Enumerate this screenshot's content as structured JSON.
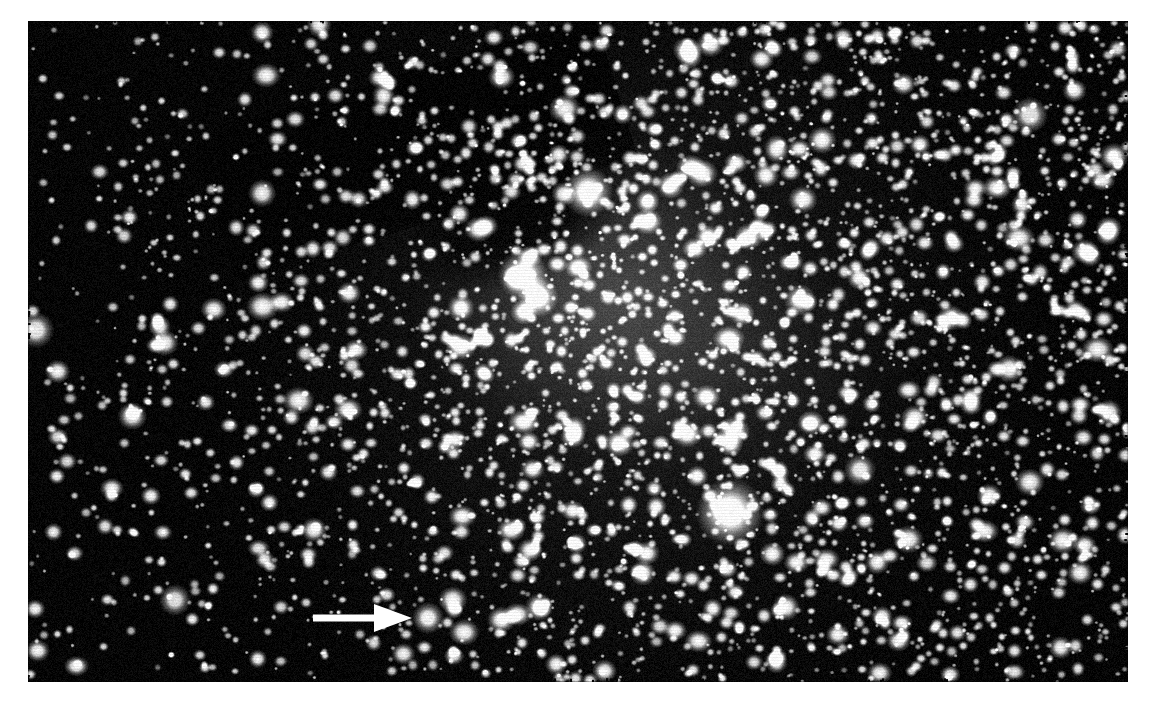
{
  "page": {
    "background_color": "#ffffff",
    "width": 1154,
    "height": 705,
    "caption": ""
  },
  "photograph": {
    "name": "astronomical-plate",
    "kind": "black-and-white astronomical photographic plate",
    "subject": "dense star field with diffuse nebulosity",
    "frame": {
      "x": 28,
      "y": 21,
      "width": 1100,
      "height": 661
    },
    "background_color": "#050505",
    "star_color": "#ffffff",
    "nebula_color": "#4a4a4a",
    "dust_lane_color": "#060606",
    "star_count": 5200,
    "density_profile": {
      "description": "star density increases strongly toward the right and center-right of the frame",
      "left_density": 0.22,
      "center_density": 0.78,
      "right_density": 1.0
    },
    "nebula": {
      "label": "diffuse nebulosity",
      "center_x": 610,
      "center_y": 300,
      "radius_x": 215,
      "radius_y": 185,
      "peak_brightness": 0.34
    },
    "dust_lane": {
      "label": "dark dust lane along upper-left rim of nebula",
      "center_x": 520,
      "center_y": 215,
      "radius_x": 125,
      "radius_y": 70
    },
    "bright_stars": [
      {
        "name": "bright-star-upper",
        "x": 588,
        "y": 192,
        "radius": 11,
        "brightness": 1.0
      },
      {
        "name": "bright-star-nebula-core",
        "x": 523,
        "y": 275,
        "radius": 11,
        "brightness": 1.0
      },
      {
        "name": "bright-star-nebula-lower",
        "x": 538,
        "y": 297,
        "radius": 9,
        "brightness": 0.97
      },
      {
        "name": "bright-star-bottom-center",
        "x": 730,
        "y": 512,
        "radius": 15,
        "brightness": 1.0
      },
      {
        "name": "arrow-target-star",
        "x": 428,
        "y": 618,
        "radius": 7,
        "brightness": 0.95
      },
      {
        "name": "bright-star-left-edge",
        "x": 36,
        "y": 330,
        "radius": 8,
        "brightness": 0.92
      },
      {
        "name": "bright-star-upper-right",
        "x": 1030,
        "y": 115,
        "radius": 8,
        "brightness": 0.9
      },
      {
        "name": "bright-star-mid-right",
        "x": 860,
        "y": 470,
        "radius": 7,
        "brightness": 0.9
      },
      {
        "name": "bright-star-lower-left",
        "x": 175,
        "y": 600,
        "radius": 7,
        "brightness": 0.88
      },
      {
        "name": "bright-star-center-right",
        "x": 800,
        "y": 300,
        "radius": 7,
        "brightness": 0.88
      }
    ]
  },
  "annotation": {
    "name": "pointer-arrow",
    "shape": "solid white right-pointing arrow",
    "color": "#ffffff",
    "shaft": {
      "x1": 313,
      "y": 618,
      "x2": 374,
      "thickness": 7
    },
    "head": {
      "base_x": 374,
      "tip_x": 412,
      "half_height": 14
    },
    "points_to": "arrow-target-star",
    "label": ""
  }
}
